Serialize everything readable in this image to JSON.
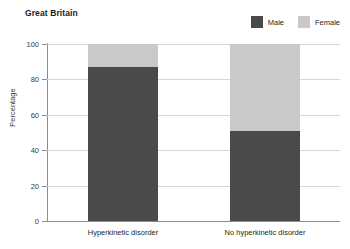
{
  "chart_data": {
    "type": "bar",
    "subtype": "stacked-100-percent",
    "title": "Great Britain",
    "xlabel": "",
    "ylabel": "Percentage",
    "ylim": [
      0,
      100
    ],
    "yticks": [
      0,
      20,
      40,
      60,
      80,
      100
    ],
    "grid": true,
    "legend_position": "top-right",
    "categories": [
      "Hyperkinetic disorder",
      "No hyperkinetic disorder"
    ],
    "series": [
      {
        "name": "Male",
        "color": "#4a4a4a",
        "values": [
          87,
          51
        ]
      },
      {
        "name": "Female",
        "color": "#c9c9c9",
        "values": [
          13,
          49
        ]
      }
    ]
  },
  "legend": {
    "items": [
      {
        "label": "Male",
        "color": "#4a4a4a"
      },
      {
        "label": "Female",
        "color": "#c9c9c9"
      }
    ]
  },
  "axis": {
    "y_title": "Percentage",
    "y_labels": [
      "100",
      "80",
      "60",
      "40",
      "20",
      "0"
    ],
    "x_labels": [
      "Hyperkinetic disorder",
      "No hyperkinetic disorder"
    ]
  }
}
